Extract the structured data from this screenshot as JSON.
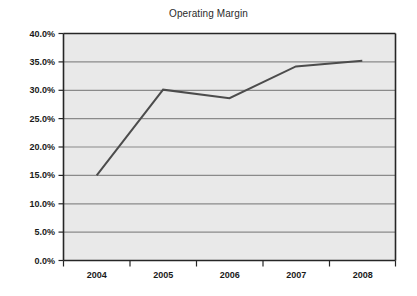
{
  "chart_data": {
    "type": "line",
    "title": "Operating Margin",
    "xlabel": "",
    "ylabel": "",
    "categories": [
      "2004",
      "2005",
      "2006",
      "2007",
      "2008"
    ],
    "values": [
      0.15,
      0.301,
      0.286,
      0.342,
      0.352
    ],
    "series": [
      {
        "name": "Operating Margin",
        "values": [
          0.15,
          0.301,
          0.286,
          0.342,
          0.352
        ]
      }
    ],
    "ylim": [
      0.0,
      0.4
    ],
    "ytick_values": [
      0.0,
      0.05,
      0.1,
      0.15,
      0.2,
      0.25,
      0.3,
      0.35,
      0.4
    ],
    "ytick_labels": [
      "0.0%",
      "5.0%",
      "10.0%",
      "15.0%",
      "20.0%",
      "25.0%",
      "30.0%",
      "35.0%",
      "40.0%"
    ],
    "xtick_labels": [
      "2004",
      "2005",
      "2006",
      "2007",
      "2008"
    ],
    "grid": "horizontal",
    "legend": "none",
    "plot_background": "#e9e9e9",
    "gridline_color": "#8a8a8a",
    "line_color": "#4c4c4c",
    "axis_color": "#262626",
    "title_color": "#2b2b2b"
  }
}
